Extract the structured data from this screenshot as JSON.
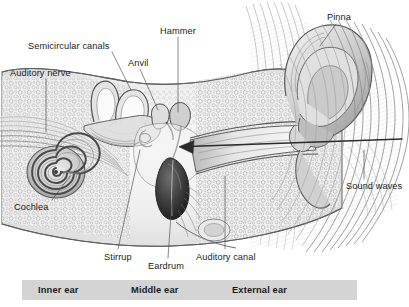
{
  "figure": {
    "type": "anatomical-cross-section",
    "background_color": "#ffffff",
    "ink_color": "#3a3a3a"
  },
  "labels": [
    {
      "id": "semicircular-canals",
      "text": "Semicircular canals",
      "x": 28,
      "y": 41
    },
    {
      "id": "auditory-nerve",
      "text": "Auditory nerve",
      "x": 10,
      "y": 68
    },
    {
      "id": "anvil",
      "text": "Anvil",
      "x": 128,
      "y": 58
    },
    {
      "id": "hammer",
      "text": "Hammer",
      "x": 160,
      "y": 26
    },
    {
      "id": "pinna",
      "text": "Pinna",
      "x": 327,
      "y": 12
    },
    {
      "id": "sound-waves",
      "text": "Sound waves",
      "x": 346,
      "y": 181
    },
    {
      "id": "cochlea",
      "text": "Cochlea",
      "x": 14,
      "y": 202
    },
    {
      "id": "stirrup",
      "text": "Stirrup",
      "x": 104,
      "y": 252
    },
    {
      "id": "eardrum",
      "text": "Eardrum",
      "x": 148,
      "y": 261
    },
    {
      "id": "auditory-canal",
      "text": "Auditory canal",
      "x": 196,
      "y": 252
    }
  ],
  "section_bar": {
    "background_color": "#d4d4d4",
    "sections": [
      {
        "id": "inner-ear",
        "text": "Inner ear",
        "x": 38
      },
      {
        "id": "middle-ear",
        "text": "Middle ear",
        "x": 131
      },
      {
        "id": "external-ear",
        "text": "External ear",
        "x": 232
      }
    ]
  },
  "annotations": {
    "sound_wave_arrow": {
      "description": "arrow indicating sound travel direction into the ear canal",
      "from_x": 402,
      "from_y": 139,
      "to_x": 180,
      "to_y": 147
    },
    "sound_wave_arcs": {
      "description": "concentric arcs representing incoming sound waves",
      "count": 14
    }
  }
}
